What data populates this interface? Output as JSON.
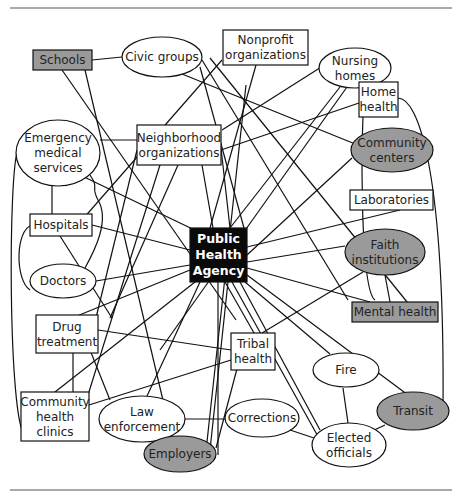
{
  "diagram": {
    "type": "network",
    "colors": {
      "white_node": "#ffffff",
      "gray_node": "#9a9a9a",
      "center_node": "#0a0a0a",
      "edge": "#111111"
    },
    "nodes": [
      {
        "id": "schools",
        "label": [
          "Schools"
        ],
        "shape": "rect",
        "fill": "gray",
        "x": 33,
        "y": 50,
        "w": 59,
        "h": 20
      },
      {
        "id": "civic",
        "label": [
          "Civic groups"
        ],
        "shape": "ellipse",
        "fill": "white",
        "cx": 162,
        "cy": 57,
        "rx": 40,
        "ry": 20
      },
      {
        "id": "nonprofit",
        "label": [
          "Nonprofit",
          "organizations"
        ],
        "shape": "rect",
        "fill": "white",
        "x": 223,
        "y": 30,
        "w": 85,
        "h": 35
      },
      {
        "id": "nursing",
        "label": [
          "Nursing",
          "homes"
        ],
        "shape": "ellipse",
        "fill": "white",
        "cx": 355,
        "cy": 68,
        "rx": 36,
        "ry": 20
      },
      {
        "id": "homehealth",
        "label": [
          "Home",
          "health"
        ],
        "shape": "rect",
        "fill": "white",
        "x": 359,
        "y": 82,
        "w": 39,
        "h": 35
      },
      {
        "id": "ems",
        "label": [
          "Emergency",
          "medical",
          "services"
        ],
        "shape": "ellipse",
        "fill": "white",
        "cx": 58,
        "cy": 153,
        "rx": 42,
        "ry": 33
      },
      {
        "id": "neighborhood",
        "label": [
          "Neighborhood",
          "organizations"
        ],
        "shape": "rect",
        "fill": "white",
        "x": 137,
        "y": 125,
        "w": 84,
        "h": 40
      },
      {
        "id": "commcenters",
        "label": [
          "Community",
          "centers"
        ],
        "shape": "ellipse",
        "fill": "gray",
        "cx": 392,
        "cy": 150,
        "rx": 41,
        "ry": 22
      },
      {
        "id": "labs",
        "label": [
          "Laboratories"
        ],
        "shape": "rect",
        "fill": "white",
        "x": 350,
        "y": 190,
        "w": 83,
        "h": 20
      },
      {
        "id": "hospitals",
        "label": [
          "Hospitals"
        ],
        "shape": "rect",
        "fill": "white",
        "x": 30,
        "y": 214,
        "w": 62,
        "h": 22
      },
      {
        "id": "faith",
        "label": [
          "Faith",
          "institutions"
        ],
        "shape": "ellipse",
        "fill": "gray",
        "cx": 385,
        "cy": 252,
        "rx": 40,
        "ry": 23
      },
      {
        "id": "pha",
        "label": [
          "Public",
          "Health",
          "Agency"
        ],
        "shape": "rect",
        "fill": "center",
        "x": 190,
        "y": 228,
        "w": 57,
        "h": 54
      },
      {
        "id": "doctors",
        "label": [
          "Doctors"
        ],
        "shape": "ellipse",
        "fill": "white",
        "cx": 63,
        "cy": 281,
        "rx": 33,
        "ry": 17
      },
      {
        "id": "mental",
        "label": [
          "Mental health"
        ],
        "shape": "rect",
        "fill": "gray",
        "x": 352,
        "y": 302,
        "w": 86,
        "h": 20
      },
      {
        "id": "drug",
        "label": [
          "Drug",
          "treatment"
        ],
        "shape": "rect",
        "fill": "white",
        "x": 36,
        "y": 315,
        "w": 62,
        "h": 38
      },
      {
        "id": "tribal",
        "label": [
          "Tribal",
          "health"
        ],
        "shape": "rect",
        "fill": "white",
        "x": 231,
        "y": 333,
        "w": 44,
        "h": 37
      },
      {
        "id": "fire",
        "label": [
          "Fire"
        ],
        "shape": "ellipse",
        "fill": "white",
        "cx": 346,
        "cy": 370,
        "rx": 33,
        "ry": 17
      },
      {
        "id": "chc",
        "label": [
          "Community",
          "health",
          "clinics"
        ],
        "shape": "rect",
        "fill": "white",
        "x": 21,
        "y": 392,
        "w": 68,
        "h": 49
      },
      {
        "id": "law",
        "label": [
          "Law",
          "enforcement"
        ],
        "shape": "ellipse",
        "fill": "white",
        "cx": 142,
        "cy": 419,
        "rx": 43,
        "ry": 23
      },
      {
        "id": "corrections",
        "label": [
          "Corrections"
        ],
        "shape": "ellipse",
        "fill": "white",
        "cx": 262,
        "cy": 418,
        "rx": 37,
        "ry": 19
      },
      {
        "id": "transit",
        "label": [
          "Transit"
        ],
        "shape": "ellipse",
        "fill": "gray",
        "cx": 413,
        "cy": 411,
        "rx": 36,
        "ry": 19
      },
      {
        "id": "employers",
        "label": [
          "Employers"
        ],
        "shape": "ellipse",
        "fill": "gray",
        "cx": 180,
        "cy": 454,
        "rx": 36,
        "ry": 18
      },
      {
        "id": "elected",
        "label": [
          "Elected",
          "officials"
        ],
        "shape": "ellipse",
        "fill": "white",
        "cx": 349,
        "cy": 445,
        "rx": 37,
        "ry": 22
      }
    ],
    "edges": [
      {
        "d": "M92,60 L122,57"
      },
      {
        "d": "M62,70 L236,320"
      },
      {
        "d": "M85,70 L170,430"
      },
      {
        "d": "M210,58 L420,318"
      },
      {
        "d": "M202,60 L348,300"
      },
      {
        "d": "M200,67 L244,228"
      },
      {
        "d": "M182,74 L370,150"
      },
      {
        "d": "M222,60 L75,228"
      },
      {
        "d": "M256,65 L210,228"
      },
      {
        "d": "M326,64 L222,130"
      },
      {
        "d": "M340,87 L230,228"
      },
      {
        "d": "M347,87 L160,350"
      },
      {
        "d": "M100,140 L137,140"
      },
      {
        "d": "M80,175 L205,235"
      },
      {
        "d": "M52,186 L52,214"
      },
      {
        "d": "M18,150 C8,170 8,420 25,436"
      },
      {
        "d": "M359,103 L221,150"
      },
      {
        "d": "M398,98 C418,98 445,170 443,410"
      },
      {
        "d": "M365,90 C360,130 360,290 375,300"
      },
      {
        "d": "M137,150 L93,330"
      },
      {
        "d": "M178,165 L110,318"
      },
      {
        "d": "M160,165 L130,260 L88,395"
      },
      {
        "d": "M202,165 L213,228"
      },
      {
        "d": "M221,148 L230,228"
      },
      {
        "d": "M352,158 L247,255"
      },
      {
        "d": "M400,210 L247,247"
      },
      {
        "d": "M92,225 L190,250"
      },
      {
        "d": "M60,236 L112,318"
      },
      {
        "d": "M32,225 C15,230 15,280 30,290"
      },
      {
        "d": "M345,246 L247,262"
      },
      {
        "d": "M363,272 L262,333"
      },
      {
        "d": "M385,275 L390,302"
      },
      {
        "d": "M96,281 L190,265"
      },
      {
        "d": "M85,268 C95,250 110,220 98,200 C90,185 100,190 90,175"
      },
      {
        "d": "M72,318 L190,270"
      },
      {
        "d": "M55,392 L195,282"
      },
      {
        "d": "M247,268 L370,302"
      },
      {
        "d": "M247,275 L408,395"
      },
      {
        "d": "M245,282 L330,354"
      },
      {
        "d": "M240,282 L320,430"
      },
      {
        "d": "M232,282 L320,440"
      },
      {
        "d": "M225,282 L258,340"
      },
      {
        "d": "M218,282 L218,455"
      },
      {
        "d": "M228,282 L210,450"
      },
      {
        "d": "M200,282 L147,396"
      },
      {
        "d": "M98,330 L231,350"
      },
      {
        "d": "M73,353 L73,392"
      },
      {
        "d": "M90,350 L110,400"
      },
      {
        "d": "M89,405 L231,360"
      },
      {
        "d": "M185,419 L225,419"
      },
      {
        "d": "M216,448 L238,365"
      },
      {
        "d": "M290,430 L320,440"
      },
      {
        "d": "M343,388 L348,423"
      },
      {
        "d": "M385,425 L370,432"
      },
      {
        "d": "M246,85 L205,460"
      }
    ],
    "rules": {
      "top_y": 8,
      "bottom_y": 490,
      "x1": 10,
      "x2": 452
    }
  }
}
